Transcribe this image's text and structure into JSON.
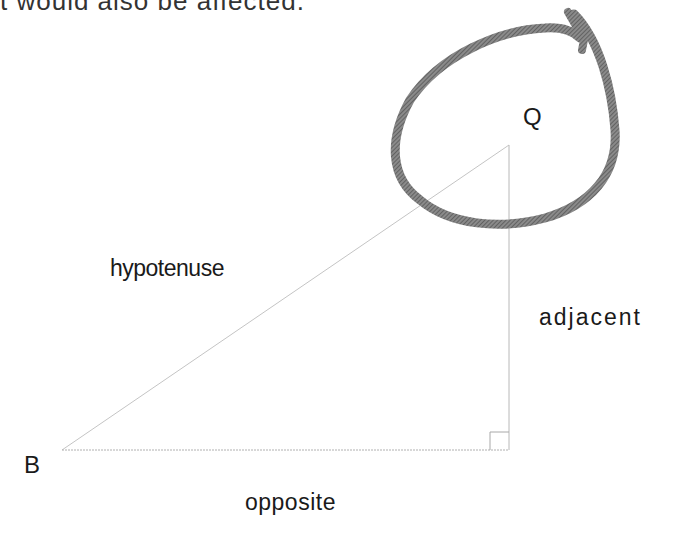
{
  "caption": "t would also be affected.",
  "labels": {
    "q": "Q",
    "b": "B",
    "hypotenuse": "hypotenuse",
    "adjacent": "adjacent",
    "opposite": "opposite"
  },
  "colors": {
    "loop": "#6e6e6e",
    "lines": "#b8b8b8",
    "text": "#1a1a1a"
  }
}
